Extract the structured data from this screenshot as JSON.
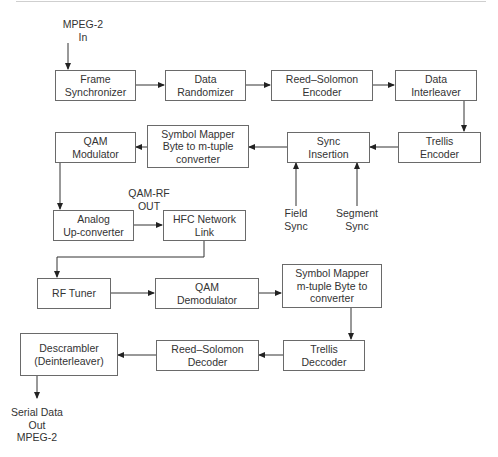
{
  "diagram": {
    "type": "block-diagram",
    "title": "",
    "inputs": {
      "mpeg_in": [
        "MPEG-2",
        "In"
      ],
      "field_sync": [
        "Field",
        "Sync"
      ],
      "segment_sync": [
        "Segment",
        "Sync"
      ]
    },
    "outputs": {
      "qam_rf_out": [
        "QAM-RF",
        "OUT"
      ],
      "serial_out": [
        "Serial Data",
        "Out",
        "MPEG-2"
      ]
    },
    "blocks": {
      "frame_sync": [
        "Frame",
        "Synchronizer"
      ],
      "data_randomizer": [
        "Data",
        "Randomizer"
      ],
      "rs_encoder": [
        "Reed–Solomon",
        "Encoder"
      ],
      "data_interleaver": [
        "Data",
        "Interleaver"
      ],
      "trellis_encoder": [
        "Trellis",
        "Encoder"
      ],
      "sync_insertion": [
        "Sync",
        "Insertion"
      ],
      "symbol_mapper_tx": [
        "Symbol Mapper",
        "Byte to m-tuple",
        "converter"
      ],
      "qam_modulator": [
        "QAM",
        "Modulator"
      ],
      "analog_upconverter": [
        "Analog",
        "Up-converter"
      ],
      "hfc_network": [
        "HFC Network",
        "Link"
      ],
      "rf_tuner": [
        "RF Tuner"
      ],
      "qam_demodulator": [
        "QAM",
        "Demodulator"
      ],
      "symbol_mapper_rx": [
        "Symbol Mapper",
        "m-tuple Byte to",
        "converter"
      ],
      "trellis_decoder": [
        "Trellis",
        "Deccoder"
      ],
      "rs_decoder": [
        "Reed–Solomon",
        "Decoder"
      ],
      "descrambler": [
        "Descrambler",
        "(Deinterleaver)"
      ]
    },
    "connections": [
      [
        "MPEG-2 In",
        "Frame Synchronizer"
      ],
      [
        "Frame Synchronizer",
        "Data Randomizer"
      ],
      [
        "Data Randomizer",
        "Reed-Solomon Encoder"
      ],
      [
        "Reed-Solomon Encoder",
        "Data Interleaver"
      ],
      [
        "Data Interleaver",
        "Trellis Encoder"
      ],
      [
        "Trellis Encoder",
        "Sync Insertion"
      ],
      [
        "Field Sync",
        "Sync Insertion"
      ],
      [
        "Segment Sync",
        "Sync Insertion"
      ],
      [
        "Sync Insertion",
        "Symbol Mapper (Byte to m-tuple)"
      ],
      [
        "Symbol Mapper (Byte to m-tuple)",
        "QAM Modulator"
      ],
      [
        "QAM Modulator",
        "Analog Up-converter"
      ],
      [
        "Analog Up-converter",
        "HFC Network Link"
      ],
      [
        "HFC Network Link",
        "RF Tuner"
      ],
      [
        "RF Tuner",
        "QAM Demodulator"
      ],
      [
        "QAM Demodulator",
        "Symbol Mapper (m-tuple Byte to)"
      ],
      [
        "Symbol Mapper (m-tuple Byte to)",
        "Trellis Deccoder"
      ],
      [
        "Trellis Deccoder",
        "Reed-Solomon Decoder"
      ],
      [
        "Reed-Solomon Decoder",
        "Descrambler (Deinterleaver)"
      ],
      [
        "Descrambler (Deinterleaver)",
        "Serial Data Out MPEG-2"
      ]
    ]
  },
  "colors": {
    "line": "#333333",
    "box_border": "#6a6a6a",
    "text": "#333333",
    "rule": "#cfcfcf"
  }
}
